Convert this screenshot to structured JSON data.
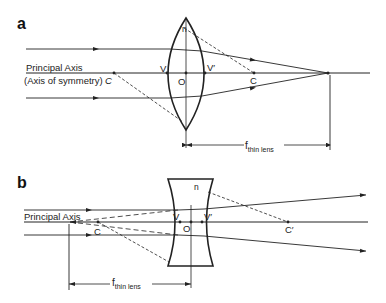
{
  "panels": [
    {
      "id": "a",
      "label": "a",
      "lens_type": "convex",
      "axis_label_1": "Principal Axis",
      "axis_label_2": "(Axis of symmetry)",
      "points": {
        "C_left": "C",
        "V": "V",
        "O": "O",
        "V_prime": "V′",
        "C_right": "C",
        "n": "n"
      },
      "focal_label_main": "f",
      "focal_label_sub": "thin lens"
    },
    {
      "id": "b",
      "label": "b",
      "lens_type": "concave",
      "axis_label_1": "Principal Axis",
      "points": {
        "C_left": "C",
        "V": "V",
        "O": "O",
        "V_prime": "V′",
        "C_right": "C′",
        "n": "n"
      },
      "focal_label_main": "f",
      "focal_label_sub": "thin lens"
    }
  ],
  "colors": {
    "line": "#222222",
    "background": "#ffffff"
  }
}
